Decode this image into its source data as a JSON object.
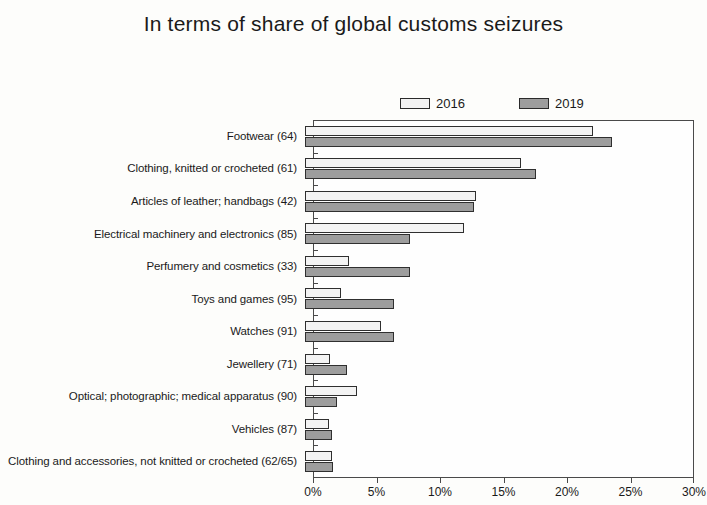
{
  "chart_data": {
    "type": "bar",
    "orientation": "horizontal",
    "title": "In terms of share of global customs seizures",
    "xlabel": "",
    "ylabel": "",
    "xlim": [
      0,
      30
    ],
    "xticks": [
      "0%",
      "5%",
      "10%",
      "15%",
      "20%",
      "25%",
      "30%"
    ],
    "xtick_values": [
      0,
      5,
      10,
      15,
      20,
      25,
      30
    ],
    "grid": false,
    "legend_position": "top",
    "value_unit": "%",
    "categories": [
      "Footwear (64)",
      "Clothing, knitted or crocheted (61)",
      "Articles of leather; handbags (42)",
      "Electrical machinery and electronics (85)",
      "Perfumery and cosmetics (33)",
      "Toys and games (95)",
      "Watches (91)",
      "Jewellery (71)",
      "Optical; photographic; medical apparatus (90)",
      "Vehicles (87)",
      "Clothing and accessories, not knitted or crocheted (62/65)"
    ],
    "series": [
      {
        "name": "2016",
        "color": "#f3f3f3",
        "values": [
          22.7,
          17.0,
          13.5,
          12.5,
          3.5,
          2.8,
          6.0,
          2.0,
          4.1,
          1.9,
          2.1
        ]
      },
      {
        "name": "2019",
        "color": "#9d9d9d",
        "values": [
          24.2,
          18.2,
          13.3,
          8.3,
          8.3,
          7.0,
          7.0,
          3.3,
          2.5,
          2.1,
          2.2
        ]
      }
    ]
  },
  "legend": {
    "items": [
      {
        "label": "2016"
      },
      {
        "label": "2019"
      }
    ]
  }
}
